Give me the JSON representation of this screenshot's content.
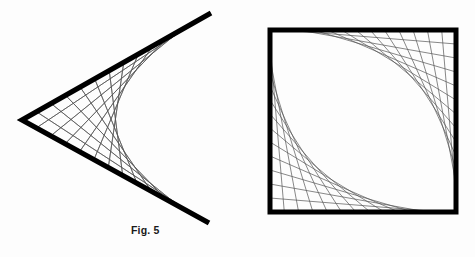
{
  "page": {
    "background_color": "#fdfdfd",
    "width": 475,
    "height": 257
  },
  "figures": [
    {
      "id": "fig-5",
      "caption": "Fig. 5",
      "kind": "string-art-envelope",
      "frame_color": "#000000",
      "string_color": "#555555",
      "frame": {
        "shape": "vee",
        "vertex": [
          22,
          120
        ],
        "upper_end": [
          211,
          13
        ],
        "lower_end": [
          209,
          223
        ],
        "stroke_width": 5.2
      },
      "strings": {
        "count": 13,
        "stroke_width": 0.7,
        "description": "segments joining the upper arm to the lower arm, envelope is a rightward-opening parabola"
      }
    },
    {
      "id": "fig-6",
      "caption": "Fig. 6",
      "kind": "string-art-envelope",
      "frame_color": "#000000",
      "string_color": "#555555",
      "frame": {
        "shape": "square",
        "left": 270,
        "top": 30,
        "right": 456,
        "bottom": 212,
        "stroke_width": 5.0
      },
      "strings": {
        "count": 13,
        "stroke_width": 0.7,
        "description": "two families of segments, each forming a parabolic envelope tangent to the square's sides"
      }
    }
  ],
  "chart_data": {
    "type": "line",
    "title": "",
    "xlabel": "",
    "ylabel": "",
    "grid": false,
    "legend": "none",
    "series": [
      {
        "name": "Fig. 5 frame (vee)",
        "x": [
          211,
          22,
          209
        ],
        "y": [
          13,
          120,
          223
        ]
      },
      {
        "name": "Fig. 5 envelope (parabola)",
        "x": [
          211,
          180,
          155,
          138,
          128,
          124,
          128,
          138,
          155,
          180,
          209
        ],
        "y": [
          13,
          40,
          62,
          85,
          103,
          119,
          135,
          153,
          176,
          199,
          223
        ]
      },
      {
        "name": "Fig. 6 frame (square)",
        "x": [
          270,
          456,
          456,
          270,
          270
        ],
        "y": [
          30,
          30,
          212,
          212,
          30
        ]
      },
      {
        "name": "Fig. 6 upper envelope",
        "x": [
          270,
          300,
          335,
          370,
          400,
          428,
          456
        ],
        "y": [
          30,
          38,
          54,
          78,
          108,
          150,
          212
        ]
      },
      {
        "name": "Fig. 6 lower envelope",
        "x": [
          270,
          284,
          300,
          322,
          350,
          390,
          456
        ],
        "y": [
          30,
          74,
          110,
          142,
          168,
          190,
          212
        ]
      }
    ],
    "xlim": [
      0,
      475
    ],
    "ylim": [
      257,
      0
    ]
  }
}
